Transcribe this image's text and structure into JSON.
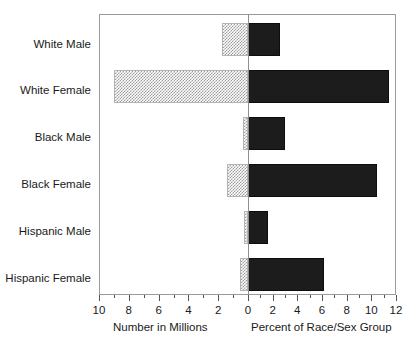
{
  "chart_data": {
    "type": "bar",
    "orientation": "horizontal",
    "style": "bidirectional-butterfly",
    "title": "",
    "subtitle": "",
    "categories": [
      "White Male",
      "White Female",
      "Black Male",
      "Black Female",
      "Hispanic Male",
      "Hispanic Female"
    ],
    "series": [
      {
        "name": "Number in Millions",
        "side": "left",
        "fill": "stippled-grey",
        "values": [
          1.75,
          9.0,
          0.35,
          1.4,
          0.3,
          0.55
        ]
      },
      {
        "name": "Percent of Race/Sex Group",
        "side": "right",
        "fill": "solid-black",
        "values": [
          2.6,
          11.4,
          3.0,
          10.5,
          1.6,
          6.2
        ]
      }
    ],
    "left_axis": {
      "label": "Number in Millions",
      "min": 0,
      "max": 10,
      "direction": "reversed",
      "ticks": [
        10,
        9,
        8,
        7,
        6,
        5,
        4,
        3,
        2,
        1,
        0
      ],
      "tick_labels": [
        "10",
        "",
        "8",
        "",
        "6",
        "",
        "4",
        "",
        "2",
        "",
        "0"
      ]
    },
    "right_axis": {
      "label": "Percent of Race/Sex Group",
      "min": 0,
      "max": 12,
      "direction": "normal",
      "ticks": [
        0,
        1,
        2,
        3,
        4,
        5,
        6,
        7,
        8,
        9,
        10,
        11,
        12
      ],
      "tick_labels": [
        "0",
        "",
        "2",
        "",
        "4",
        "",
        "6",
        "",
        "8",
        "",
        "10",
        "",
        "12"
      ]
    },
    "xlabel": "",
    "ylabel": "",
    "grid": false,
    "legend": "none",
    "annotations": []
  },
  "axis_titles": {
    "left": "Number in Millions",
    "right": "Percent of Race/Sex Group"
  },
  "xtick_labels": [
    "10",
    "8",
    "6",
    "4",
    "2",
    "0",
    "2",
    "4",
    "6",
    "8",
    "10",
    "12"
  ],
  "colors": {
    "bar_left_fill": "#9d9d9d",
    "bar_right_fill": "#1c1c1c",
    "frame": "#9a9a9a",
    "zero_line": "#8f8f8f",
    "text": "#1a1a1a",
    "background": "#ffffff"
  }
}
